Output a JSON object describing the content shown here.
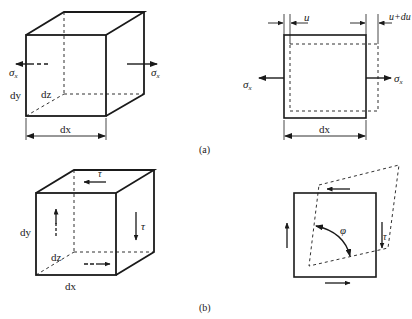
{
  "figure": {
    "panel_a": {
      "caption": "(a)",
      "cube": {
        "dx_label": "dx",
        "dy_label": "dy",
        "dz_label": "dz",
        "stress_left": {
          "symbol": "σ",
          "sub": "x"
        },
        "stress_right": {
          "symbol": "σ",
          "sub": "x"
        }
      },
      "deformation": {
        "u_label": "u",
        "u_du_label": "u+du",
        "dx_label": "dx",
        "stress_left": {
          "symbol": "σ",
          "sub": "x"
        },
        "stress_right": {
          "symbol": "σ",
          "sub": "x"
        }
      }
    },
    "panel_b": {
      "caption": "(b)",
      "cube": {
        "dx_label": "dx",
        "dy_label": "dy",
        "dz_label": "dz",
        "tau_top": "τ",
        "tau_right": "τ"
      },
      "shear": {
        "tau_label": "τ",
        "angle_label": "φ"
      }
    },
    "colors": {
      "line": "#1a1a1a",
      "dashed": "#333333",
      "background": "#ffffff"
    }
  }
}
